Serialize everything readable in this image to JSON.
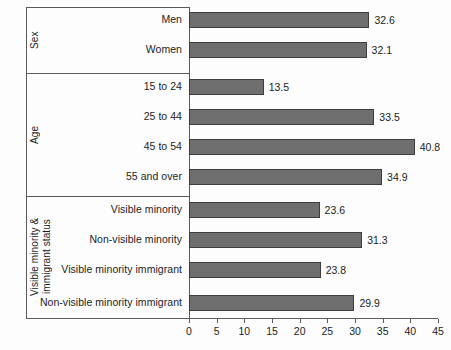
{
  "chart_data": {
    "type": "bar",
    "orientation": "horizontal",
    "title": "",
    "xlabel": "",
    "ylabel": "",
    "xlim": [
      0,
      45
    ],
    "xticks": [
      0,
      5,
      10,
      15,
      20,
      25,
      30,
      35,
      40,
      45
    ],
    "grid": false,
    "legend": null,
    "bar_color": "#6e6e6e",
    "bar_edge_color": "#3d3d3d",
    "groups": [
      {
        "label": "Sex",
        "categories": [
          "Men",
          "Women"
        ],
        "values": [
          32.6,
          32.1
        ]
      },
      {
        "label": "Age",
        "categories": [
          "15 to 24",
          "25 to 44",
          "45 to 54",
          "55 and over"
        ],
        "values": [
          13.5,
          33.5,
          40.8,
          34.9
        ]
      },
      {
        "label": "Visible minority &\nimmigrant status",
        "categories": [
          "Visible minority",
          "Non-visible minority",
          "Visible minority immigrant",
          "Non-visible minority immigrant"
        ],
        "values": [
          23.6,
          31.3,
          23.8,
          29.9
        ]
      }
    ],
    "categories": [
      "Men",
      "Women",
      "15 to 24",
      "25 to 44",
      "45 to 54",
      "55 and over",
      "Visible minority",
      "Non-visible minority",
      "Visible minority immigrant",
      "Non-visible minority immigrant"
    ],
    "values": [
      32.6,
      32.1,
      13.5,
      33.5,
      40.8,
      34.9,
      23.6,
      31.3,
      23.8,
      29.9
    ],
    "value_labels": [
      "32.6",
      "32.1",
      "13.5",
      "33.5",
      "40.8",
      "34.9",
      "23.6",
      "31.3",
      "23.8",
      "29.9"
    ],
    "tick_labels": [
      "0",
      "5",
      "10",
      "15",
      "20",
      "25",
      "30",
      "35",
      "40",
      "45"
    ]
  }
}
